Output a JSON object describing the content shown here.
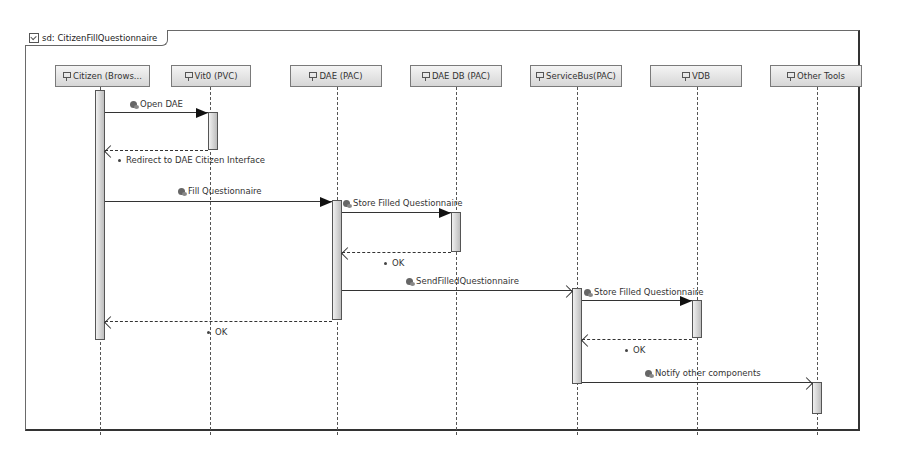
{
  "diagram": {
    "frame_title": "sd: CitizenFillQuestionnaire",
    "lifelines": [
      {
        "id": "citizen",
        "label": "Citizen (Brows...",
        "x": 100
      },
      {
        "id": "vit0",
        "label": "Vit0 (PVC)",
        "x": 210
      },
      {
        "id": "dae",
        "label": "DAE (PAC)",
        "x": 337
      },
      {
        "id": "daedb",
        "label": "DAE DB (PAC)",
        "x": 456
      },
      {
        "id": "servicebus",
        "label": "ServiceBus(PAC)",
        "x": 577
      },
      {
        "id": "vdb",
        "label": "VDB",
        "x": 697
      },
      {
        "id": "othertools",
        "label": "Other Tools",
        "x": 817
      }
    ],
    "messages": [
      {
        "label": "Open DAE",
        "type": "sync",
        "from": "citizen",
        "to": "vit0"
      },
      {
        "label": "Redirect to DAE Citizen Interface",
        "type": "reply",
        "from": "vit0",
        "to": "citizen"
      },
      {
        "label": "Fill Questionnaire",
        "type": "sync",
        "from": "citizen",
        "to": "dae"
      },
      {
        "label": "Store Filled Questionnaire",
        "type": "sync",
        "from": "dae",
        "to": "daedb"
      },
      {
        "label": "OK",
        "type": "reply",
        "from": "daedb",
        "to": "dae"
      },
      {
        "label": "SendFilledQuestionnaire",
        "type": "async",
        "from": "dae",
        "to": "servicebus"
      },
      {
        "label": "OK",
        "type": "reply",
        "from": "dae",
        "to": "citizen"
      },
      {
        "label": "Store Filled Questionnaire",
        "type": "sync",
        "from": "servicebus",
        "to": "vdb"
      },
      {
        "label": "OK",
        "type": "reply",
        "from": "vdb",
        "to": "servicebus"
      },
      {
        "label": "Notify other components",
        "type": "async",
        "from": "servicebus",
        "to": "othertools"
      }
    ]
  }
}
